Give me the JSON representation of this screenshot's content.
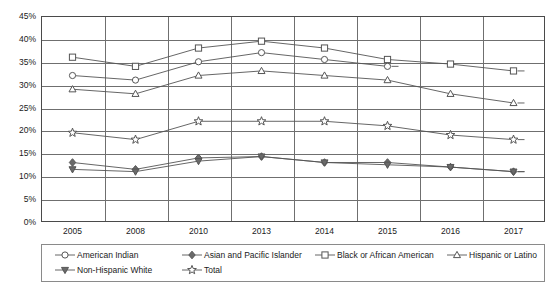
{
  "chart_data": {
    "type": "line",
    "title": "",
    "subtitle": "",
    "xlabel": "",
    "ylabel": "",
    "categories": [
      "2005",
      "2008",
      "2010",
      "2013",
      "2014",
      "2015",
      "2016",
      "2017"
    ],
    "ylim": [
      0,
      45
    ],
    "ytick_labels": [
      "45%",
      "40%",
      "35%",
      "30%",
      "25%",
      "20%",
      "15%",
      "10%",
      "5%",
      "0%"
    ],
    "ytick_values": [
      45,
      40,
      35,
      30,
      25,
      20,
      15,
      10,
      5,
      0
    ],
    "ytick_step": 5,
    "grid": true,
    "grid_horizontal": true,
    "grid_vertical": true,
    "legend_position": "bottom",
    "value_suffix": "%",
    "series": [
      {
        "name": "American Indian",
        "marker": "circle-open",
        "color": "#555555",
        "values": [
          32,
          31,
          35,
          37,
          35.5,
          34,
          null,
          null
        ]
      },
      {
        "name": "Asian and Pacific Islander",
        "marker": "diamond-filled",
        "color": "#555555",
        "values": [
          13,
          11.5,
          14,
          14.3,
          13,
          13,
          12,
          11
        ]
      },
      {
        "name": "Black or African American",
        "marker": "square-open",
        "color": "#555555",
        "values": [
          36,
          34,
          38,
          39.5,
          38,
          35.5,
          34.5,
          33
        ]
      },
      {
        "name": "Hispanic or Latino",
        "marker": "triangle-open",
        "color": "#555555",
        "values": [
          29,
          28,
          32,
          33,
          32,
          31,
          28,
          26
        ]
      },
      {
        "name": "Non-Hispanic White",
        "marker": "triangle-down-filled",
        "color": "#555555",
        "values": [
          11.5,
          11,
          13.3,
          14.3,
          13,
          12.5,
          12,
          11
        ]
      },
      {
        "name": "Total",
        "marker": "star-open",
        "color": "#555555",
        "values": [
          19.5,
          18,
          22,
          22,
          22,
          21,
          19,
          18
        ]
      }
    ]
  },
  "legend": {
    "rows": [
      [
        {
          "label": "American Indian",
          "marker": "circle-open"
        },
        {
          "label": "Asian and Pacific Islander",
          "marker": "diamond-filled"
        },
        {
          "label": "Black or African American",
          "marker": "square-open"
        },
        {
          "label": "Hispanic or Latino",
          "marker": "triangle-open"
        }
      ],
      [
        {
          "label": "Non-Hispanic White",
          "marker": "triangle-down-filled"
        },
        {
          "label": "Total",
          "marker": "star-open"
        }
      ]
    ]
  }
}
